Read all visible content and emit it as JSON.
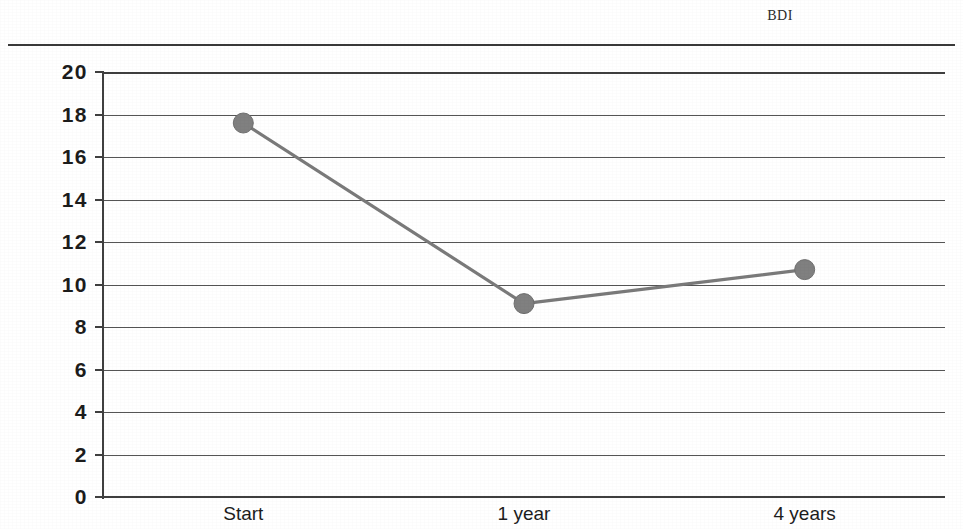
{
  "chart_data": {
    "type": "line",
    "title": "BDI",
    "xlabel": "",
    "ylabel": "",
    "categories": [
      "Start",
      "1 year",
      "4 years"
    ],
    "values": [
      17.6,
      9.1,
      10.7
    ],
    "series": [
      {
        "name": "BDI",
        "values": [
          17.6,
          9.1,
          10.7
        ]
      }
    ],
    "ylim": [
      0,
      20
    ],
    "ytick_labels": [
      "20",
      "18",
      "16",
      "14",
      "12",
      "10",
      "8",
      "6",
      "4",
      "2",
      "0"
    ],
    "yticks": [
      20,
      18,
      16,
      14,
      12,
      10,
      8,
      6,
      4,
      2,
      0
    ],
    "grid": true,
    "grid_axis": "y",
    "legend": false,
    "legend_position": "none",
    "markers": true,
    "marker_shape": "circle",
    "line_color": "#7a7a7a",
    "marker_color": "#808080",
    "grid_color": "#555555",
    "axis_color": "#3f3f3f",
    "background_color": "#ffffff"
  },
  "figure": {
    "title_text": "BDI",
    "divider": "top-horizontal-rule"
  }
}
